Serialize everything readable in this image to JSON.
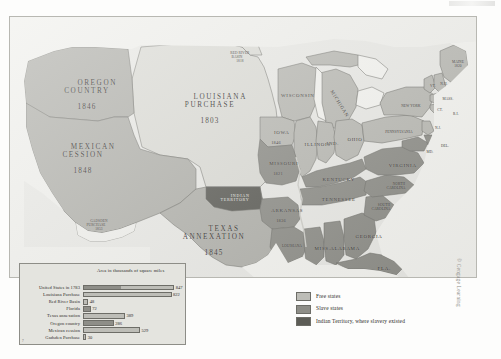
{
  "figure": {
    "credit": "© Cengage Learning"
  },
  "colors": {
    "free_states": "#bdbdb7",
    "slave_states": "#8e8e88",
    "indian_territory": "#5c5c56",
    "unorganized": "#dcdcd6",
    "water": "#f2f2ee",
    "background": "#e9e9e5",
    "outline": "#6d6d67",
    "text": "#2c2a27"
  },
  "territories": [
    {
      "name": "OREGON\nCOUNTRY",
      "year": "1846"
    },
    {
      "name": "MEXICAN\nCESSION",
      "year": "1848"
    },
    {
      "name": "LOUISIANA\nPURCHASE",
      "year": "1803"
    },
    {
      "name": "TEXAS\nANNEXATION",
      "year": "1845"
    },
    {
      "name": "INDIAN\nTERRITORY",
      "year": ""
    },
    {
      "name": "RED RIVER\nBASIN",
      "year": "1818"
    },
    {
      "name": "GADSDEN\nPURCHASE",
      "year": "1853"
    }
  ],
  "map_labels": {
    "oregon_country": "OREGON\nCOUNTRY",
    "oregon_country_year": "1846",
    "mexican_cession": "MEXICAN\nCESSION",
    "mexican_cession_year": "1848",
    "louisiana_purchase": "LOUISIANA\nPURCHASE",
    "louisiana_purchase_year": "1803",
    "texas_annexation": "TEXAS\nANNEXATION",
    "texas_annexation_year": "1845",
    "indian_territory": "INDIAN\nTERRITORY",
    "red_river_basin": "RED RIVER\nBASIN",
    "red_river_basin_year": "1818",
    "gadsden_purchase": "GADSDEN\nPURCHASE",
    "gadsden_purchase_year": "1853"
  },
  "states": [
    {
      "name": "WISCONSIN",
      "year": ""
    },
    {
      "name": "MICHIGAN",
      "year": ""
    },
    {
      "name": "IOWA",
      "year": "1846"
    },
    {
      "name": "MISSOURI",
      "year": "1821"
    },
    {
      "name": "ARKANSAS",
      "year": "1836"
    },
    {
      "name": "LOUISIANA",
      "year": ""
    },
    {
      "name": "ILLINOIS",
      "year": ""
    },
    {
      "name": "IND.",
      "year": ""
    },
    {
      "name": "OHIO",
      "year": ""
    },
    {
      "name": "KENTUCKY",
      "year": ""
    },
    {
      "name": "TENNESSEE",
      "year": ""
    },
    {
      "name": "MISS.",
      "year": ""
    },
    {
      "name": "ALABAMA",
      "year": ""
    },
    {
      "name": "GEORGIA",
      "year": ""
    },
    {
      "name": "FLA.",
      "year": "1845"
    },
    {
      "name": "SOUTH\nCAROLINA",
      "year": ""
    },
    {
      "name": "NORTH\nCAROLINA",
      "year": ""
    },
    {
      "name": "VIRGINIA",
      "year": ""
    },
    {
      "name": "PENNSYLVANIA",
      "year": ""
    },
    {
      "name": "NEW YORK",
      "year": ""
    },
    {
      "name": "MAINE",
      "year": "1820"
    },
    {
      "name": "VT.",
      "year": ""
    },
    {
      "name": "N.H.",
      "year": ""
    },
    {
      "name": "MASS.",
      "year": ""
    },
    {
      "name": "CT.",
      "year": ""
    },
    {
      "name": "R.I.",
      "year": ""
    },
    {
      "name": "N.J.",
      "year": ""
    },
    {
      "name": "DEL.",
      "year": ""
    },
    {
      "name": "MD.",
      "year": ""
    }
  ],
  "state_labels": {
    "wisconsin": "WISCONSIN",
    "michigan": "MICHIGAN",
    "iowa": "IOWA",
    "iowa_year": "1846",
    "missouri": "MISSOURI",
    "missouri_year": "1821",
    "arkansas": "ARKANSAS",
    "arkansas_year": "1836",
    "louisiana": "LOUISIANA",
    "illinois": "ILLINOIS",
    "indiana": "IND.",
    "ohio": "OHIO",
    "kentucky": "KENTUCKY",
    "tennessee": "TENNESSEE",
    "mississippi": "MISS.",
    "alabama": "ALABAMA",
    "georgia": "GEORGIA",
    "florida": "FLA.",
    "florida_year": "1845",
    "south_carolina": "SOUTH\nCAROLINA",
    "north_carolina": "NORTH\nCAROLINA",
    "virginia": "VIRGINIA",
    "pennsylvania": "PENNSYLVANIA",
    "new_york": "NEW YORK",
    "maine": "MAINE",
    "maine_year": "1820",
    "vermont": "VT.",
    "new_hampshire": "N.H.",
    "massachusetts": "MASS.",
    "connecticut": "CT.",
    "rhode_island": "R.I.",
    "new_jersey": "N.J.",
    "delaware": "DEL.",
    "maryland": "MD."
  },
  "key": {
    "items": [
      {
        "label": "Free states",
        "color": "#bdbdb7"
      },
      {
        "label": "Slave states",
        "color": "#8e8e88"
      },
      {
        "label": "Indian Territory,\nwhere slavery existed",
        "color": "#5c5c56"
      }
    ]
  },
  "chart_data": {
    "type": "bar",
    "title": "Area in thousands\nof square miles",
    "xlabel": "",
    "ylabel": "",
    "orientation": "horizontal",
    "xlim": [
      0,
      900
    ],
    "grid": false,
    "legend": "none",
    "categories": [
      "United States in 1783",
      "Louisiana Purchase",
      "Red River Basin",
      "Florida",
      "Texas annexation",
      "Oregon country",
      "Mexican cession",
      "Gadsden Purchase"
    ],
    "values": [
      847,
      822,
      48,
      72,
      389,
      286,
      529,
      30
    ],
    "value_labels": [
      "847",
      "822",
      "48",
      "72",
      "389",
      "286",
      "529",
      "30"
    ],
    "bar_shades": [
      "mixed",
      "light",
      "light",
      "dark",
      "light",
      "dark",
      "light",
      "light"
    ],
    "corner_mark": "7"
  }
}
